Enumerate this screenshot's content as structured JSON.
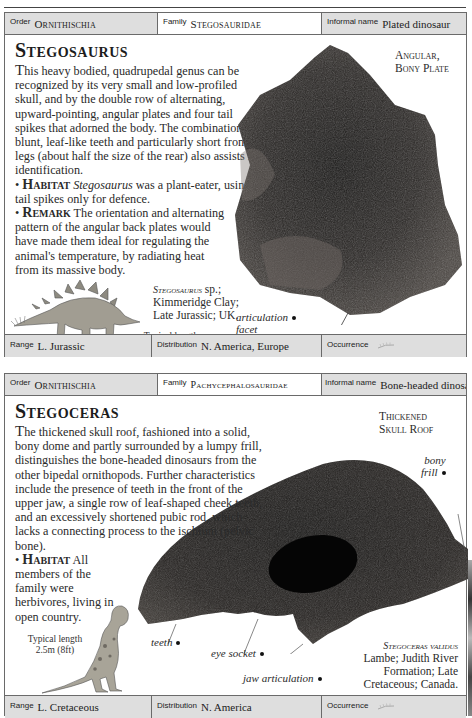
{
  "cards": [
    {
      "header": {
        "order_label": "Order",
        "order_value": "Ornithischia",
        "family_label": "Family",
        "family_value": "Stegosauridae",
        "informal_label": "Informal name",
        "informal_value": "Plated dinosaur"
      },
      "title": "Stegosaurus",
      "description": "his heavy bodied, quadrupedal genus can be recognized by its very small and low-profiled skull, and by the double row of alternating, upward-pointing, angular plates and four tail spikes that adorned the body. The combination of blunt, leaf-like teeth and particularly short front legs (about half the size of the rear) also assists in identification.",
      "description_dropcap": "T",
      "habitat_label": "Habitat",
      "habitat_genus": "Stegosaurus",
      "habitat_text": " was a plant-eater, using its tail spikes only for defence.",
      "remark_label": "Remark",
      "remark_text": " The orientation and alternating pattern of the angular back plates would have made them ideal for regulating the animal's temperature, by radiating heat from its massive body.",
      "specimen_caption_line1": "Angular,",
      "specimen_caption_line2": "Bony Plate",
      "specimen_name": "Stegosaurus",
      "specimen_name_suffix": " sp.;",
      "specimen_locality1": "Kimmeridge Clay;",
      "specimen_locality2": "Late Jurassic; UK.",
      "typical_length_label": "Typical length",
      "typical_length_value": "9m (30ft)",
      "annotations": [
        {
          "line1": "articulation",
          "line2": "facet"
        }
      ],
      "footer": {
        "range_label": "Range",
        "range_value": "L. Jurassic",
        "distribution_label": "Distribution",
        "distribution_value": "N. America, Europe",
        "occurrence_label": "Occurrence",
        "occurrence_icon": "fern-icon"
      }
    },
    {
      "header": {
        "order_label": "Order",
        "order_value": "Ornithischia",
        "family_label": "Family",
        "family_value": "Pachycephalosauridae",
        "informal_label": "Informal name",
        "informal_value": "Bone-headed dinosaur"
      },
      "title": "Stegoceras",
      "description_dropcap": "T",
      "description": "he thickened skull roof, fashioned into a solid, bony dome and partly surrounded by a lumpy frill, distinguishes the bone-headed dinosaurs from the other bipedal ornithopods. Further characteristics include the presence of teeth in the front of the upper jaw, a single row of leaf-shaped cheek teeth, and an excessively shortened pubic rod, which lacks a connecting process to the ischium (pelvic bone).",
      "habitat_label": "Habitat",
      "habitat_text": " All members of the family were herbivores, living in open country.",
      "specimen_caption_line1": "Thickened",
      "specimen_caption_line2": "Skull Roof",
      "specimen_name": "Stegoceras validus",
      "specimen_locality1": "Lambe; Judith River",
      "specimen_locality2": "Formation; Late",
      "specimen_locality3": "Cretaceous; Canada.",
      "typical_length_label": "Typical length",
      "typical_length_value": "2.5m (8ft)",
      "annotations": [
        {
          "line1": "bony",
          "line2": "frill"
        },
        {
          "line1": "teeth"
        },
        {
          "line1": "eye socket"
        },
        {
          "line1": "jaw articulation"
        }
      ],
      "footer": {
        "range_label": "Range",
        "range_value": "L. Cretaceous",
        "distribution_label": "Distribution",
        "distribution_value": "N. America",
        "occurrence_label": "Occurrence",
        "occurrence_icon": "fern-icon"
      }
    }
  ],
  "colors": {
    "header_grey": "#dedede",
    "border": "#6a6a6a",
    "fossil_dark": "#1f1d1b"
  }
}
